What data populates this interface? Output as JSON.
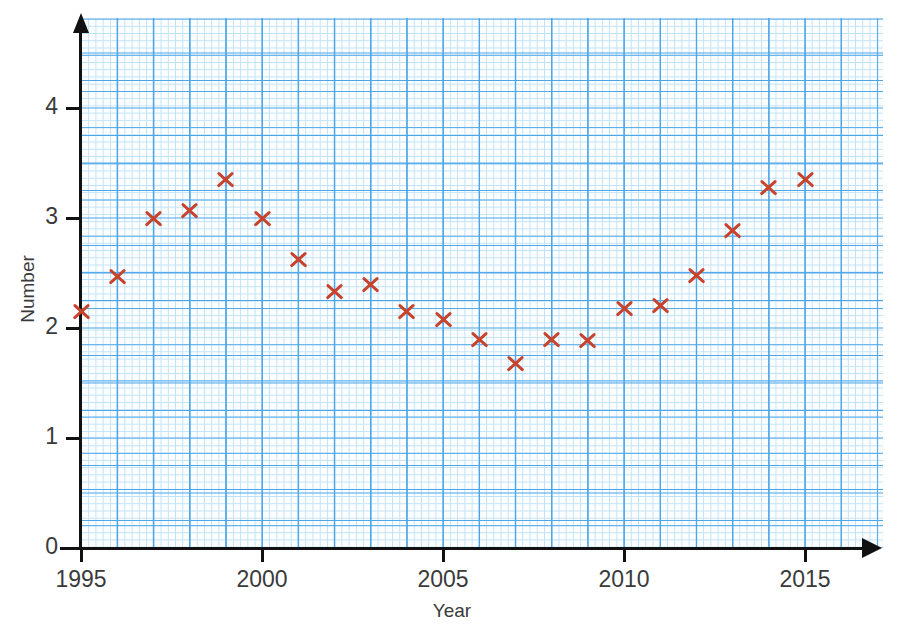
{
  "chart_data": {
    "type": "scatter",
    "title": "",
    "xlabel": "Year",
    "ylabel": "Number",
    "xlim": [
      1995,
      2016.1
    ],
    "ylim": [
      0,
      4.66
    ],
    "xticks": [
      1995,
      2000,
      2005,
      2010,
      2015
    ],
    "xtick_labels": [
      "1995",
      "2000",
      "2005",
      "2010",
      "2015"
    ],
    "yticks": [
      0,
      1,
      2,
      3,
      4
    ],
    "ytick_labels": [
      "0",
      "1",
      "2",
      "3",
      "4"
    ],
    "grid": true,
    "grid_style": "graph-paper",
    "grid_minor_step_x": 0.2,
    "grid_minor_step_y": 0.05,
    "grid_major_step_x": 1,
    "grid_major_step_y": 0.25,
    "legend": false,
    "marker": "x",
    "marker_color": "#c8432c",
    "grid_color_major": "#4da6e8",
    "grid_color_minor": "#bfe2f7",
    "axis_color": "#111111",
    "text_color": "#3a3a3a",
    "x": [
      1995,
      1996,
      1997,
      1998,
      1999,
      2000,
      2001,
      2002,
      2003,
      2004,
      2005,
      2006,
      2007,
      2008,
      2009,
      2010,
      2011,
      2012,
      2013,
      2014,
      2015
    ],
    "y": [
      2.15,
      2.47,
      3.0,
      3.07,
      3.35,
      3.0,
      2.62,
      2.33,
      2.4,
      2.15,
      2.08,
      1.9,
      1.68,
      1.9,
      1.89,
      2.18,
      2.21,
      2.48,
      2.89,
      3.28,
      3.35
    ],
    "points": [
      {
        "year": 1995,
        "value": 2.15
      },
      {
        "year": 1996,
        "value": 2.47
      },
      {
        "year": 1997,
        "value": 3.0
      },
      {
        "year": 1998,
        "value": 3.07
      },
      {
        "year": 1999,
        "value": 3.35
      },
      {
        "year": 2000,
        "value": 3.0
      },
      {
        "year": 2001,
        "value": 2.62
      },
      {
        "year": 2002,
        "value": 2.33
      },
      {
        "year": 2003,
        "value": 2.4
      },
      {
        "year": 2004,
        "value": 2.15
      },
      {
        "year": 2005,
        "value": 2.08
      },
      {
        "year": 2006,
        "value": 1.9
      },
      {
        "year": 2007,
        "value": 1.68
      },
      {
        "year": 2008,
        "value": 1.9
      },
      {
        "year": 2009,
        "value": 1.89
      },
      {
        "year": 2010,
        "value": 2.18
      },
      {
        "year": 2011,
        "value": 2.21
      },
      {
        "year": 2012,
        "value": 2.48
      },
      {
        "year": 2013,
        "value": 2.89
      },
      {
        "year": 2014,
        "value": 3.28
      },
      {
        "year": 2015,
        "value": 3.35
      }
    ]
  }
}
